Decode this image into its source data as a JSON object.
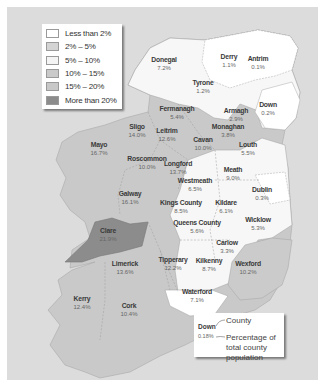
{
  "legend": {
    "items": [
      {
        "label": "Less than 2%",
        "color": "#ffffff"
      },
      {
        "label": "2% – 5%",
        "color": "#d4d4d4"
      },
      {
        "label": "5% – 10%",
        "color": "#f4f4f4"
      },
      {
        "label": "10% – 15%",
        "color": "#cacaca"
      },
      {
        "label": "15% – 20%",
        "color": "#c8c8c8"
      },
      {
        "label": "More than 20%",
        "color": "#8c8c8c"
      }
    ]
  },
  "counties": [
    {
      "name": "Donegal",
      "pct": "7.2%"
    },
    {
      "name": "Derry",
      "pct": "1.1%"
    },
    {
      "name": "Antrim",
      "pct": "0.1%"
    },
    {
      "name": "Tyrone",
      "pct": "1.2%"
    },
    {
      "name": "Fermanagh",
      "pct": "5.4%"
    },
    {
      "name": "Armagh",
      "pct": "2.9%"
    },
    {
      "name": "Down",
      "pct": "0.2%"
    },
    {
      "name": "Sligo",
      "pct": "14.0%"
    },
    {
      "name": "Leitrim",
      "pct": "12.6%"
    },
    {
      "name": "Monaghan",
      "pct": "3.8%"
    },
    {
      "name": "Cavan",
      "pct": "10.0%"
    },
    {
      "name": "Mayo",
      "pct": "16.7%"
    },
    {
      "name": "Louth",
      "pct": "5.5%"
    },
    {
      "name": "Roscommon",
      "pct": "10.0%"
    },
    {
      "name": "Longford",
      "pct": "13.7%"
    },
    {
      "name": "Meath",
      "pct": "9.0%"
    },
    {
      "name": "Westmeath",
      "pct": "6.5%"
    },
    {
      "name": "Dublin",
      "pct": "0.3%"
    },
    {
      "name": "Galway",
      "pct": "16.1%"
    },
    {
      "name": "Kings County",
      "pct": "8.5%"
    },
    {
      "name": "Kildare",
      "pct": "6.1%"
    },
    {
      "name": "Queens County",
      "pct": "5.6%"
    },
    {
      "name": "Wicklow",
      "pct": "5.3%"
    },
    {
      "name": "Clare",
      "pct": "21.9%"
    },
    {
      "name": "Carlow",
      "pct": "3.3%"
    },
    {
      "name": "Limerick",
      "pct": "13.6%"
    },
    {
      "name": "Tipperary",
      "pct": "12.2%"
    },
    {
      "name": "Kilkenny",
      "pct": "8.7%"
    },
    {
      "name": "Wexford",
      "pct": "10.2%"
    },
    {
      "name": "Waterford",
      "pct": "7.1%"
    },
    {
      "name": "Kerry",
      "pct": "12.4%"
    },
    {
      "name": "Cork",
      "pct": "10.4%"
    }
  ],
  "key": {
    "example_county": "Down",
    "example_pct": "0.18%",
    "county_desc": "County",
    "pct_desc": "Percentage of total county population"
  },
  "colors": {
    "sea": "#dcdcdc",
    "land_mid": "#c9c9c9",
    "land_light": "#f7f7f7",
    "land_white": "#ffffff",
    "land_dark": "#8c8c8c"
  }
}
